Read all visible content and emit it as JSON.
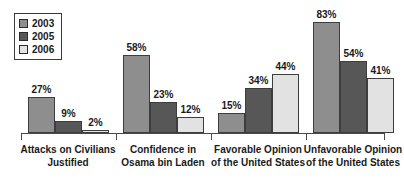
{
  "chart_data": {
    "type": "bar",
    "title": "",
    "subtitle": "",
    "xlabel": "",
    "ylabel": "",
    "ylim": [
      0,
      100
    ],
    "grid": false,
    "legend_position": "top-left",
    "categories": [
      "Attacks on Civilians Justified",
      "Confidence in Osama bin Laden",
      "Favorable Opinion of the United States",
      "Unfavorable Opinion of the United States"
    ],
    "category_lines": [
      [
        "Attacks on Civilians",
        "Justified"
      ],
      [
        "Confidence in",
        "Osama bin Laden"
      ],
      [
        "Favorable Opinion",
        "of the United States"
      ],
      [
        "Unfavorable Opinion",
        "of the United States"
      ]
    ],
    "series": [
      {
        "name": "2003",
        "color": "#8e8e8e",
        "values": [
          27,
          58,
          15,
          83
        ],
        "labels": [
          "27%",
          "58%",
          "15%",
          "83%"
        ]
      },
      {
        "name": "2005",
        "color": "#575757",
        "values": [
          9,
          23,
          34,
          54
        ],
        "labels": [
          "9%",
          "23%",
          "34%",
          "54%"
        ]
      },
      {
        "name": "2006",
        "color": "#e2e2e2",
        "values": [
          2,
          12,
          44,
          41
        ],
        "labels": [
          "2%",
          "12%",
          "44%",
          "41%"
        ]
      }
    ]
  },
  "legend": {
    "items": [
      {
        "label": "2003",
        "color": "#8e8e8e"
      },
      {
        "label": "2005",
        "color": "#575757"
      },
      {
        "label": "2006",
        "color": "#e2e2e2"
      }
    ]
  },
  "colors": {
    "series_2003": "#8e8e8e",
    "series_2005": "#575757",
    "series_2006": "#e2e2e2",
    "axis": "#4a4a4a",
    "text": "#1a1a1a",
    "background": "#ffffff"
  }
}
